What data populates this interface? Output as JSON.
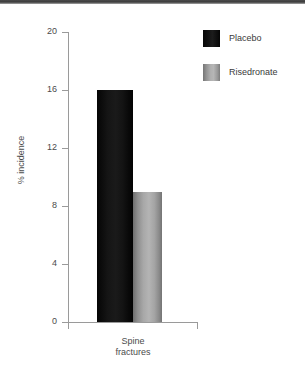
{
  "chart_data": {
    "type": "bar",
    "title": "",
    "xlabel": "Spine fractures",
    "ylabel": "% incidence",
    "categories": [
      "Spine fractures"
    ],
    "category_lines": [
      "Spine",
      "fractures"
    ],
    "series": [
      {
        "name": "Placebo",
        "values": [
          16
        ],
        "color": "#111111"
      },
      {
        "name": "Risedronate",
        "values": [
          9
        ],
        "color": "#a9a9a9"
      }
    ],
    "ylim": [
      0,
      20
    ],
    "yticks": [
      20,
      16,
      12,
      8,
      4,
      0
    ],
    "ytick_labels": [
      "20",
      "16",
      "12",
      "8",
      "4",
      "0"
    ],
    "grid": false,
    "legend_position": "top-right"
  },
  "legend": {
    "items": [
      {
        "label": "Placebo",
        "swatch": "dark-swatch-icon"
      },
      {
        "label": "Risedronate",
        "swatch": "gray-swatch-icon"
      }
    ]
  },
  "axis": {
    "y_title": "% incidence",
    "ticks": [
      "20",
      "16",
      "12",
      "8",
      "4",
      "0"
    ]
  }
}
